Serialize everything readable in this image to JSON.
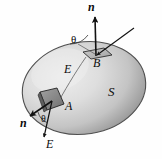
{
  "figure": {
    "background_color": "#fefefe",
    "surface": {
      "label": "S",
      "fill_light": "#e2e2e2",
      "fill_mid": "#c9c9c9",
      "fill_dark": "#9c9c9c",
      "outline_color": "#4a4a4a"
    },
    "patches": {
      "a": {
        "label": "A",
        "fill": "#8d8d8d",
        "edge": "#2f2f2f"
      },
      "b": {
        "label": "B",
        "fill": "#b6b6b6",
        "edge": "#2f2f2f"
      }
    },
    "vectors": {
      "normal_top": {
        "label": "n",
        "style": "bold-italic"
      },
      "normal_bottom": {
        "label": "n",
        "style": "bold-italic"
      },
      "field_top": {
        "label": "E",
        "style": "italic"
      },
      "field_middle": {
        "label": "E",
        "style": "italic"
      },
      "field_bottom": {
        "label": "E",
        "style": "italic"
      }
    },
    "angles": {
      "top": {
        "label": "θ"
      },
      "bottom": {
        "label": "θ"
      }
    },
    "line_color": "#111111"
  }
}
